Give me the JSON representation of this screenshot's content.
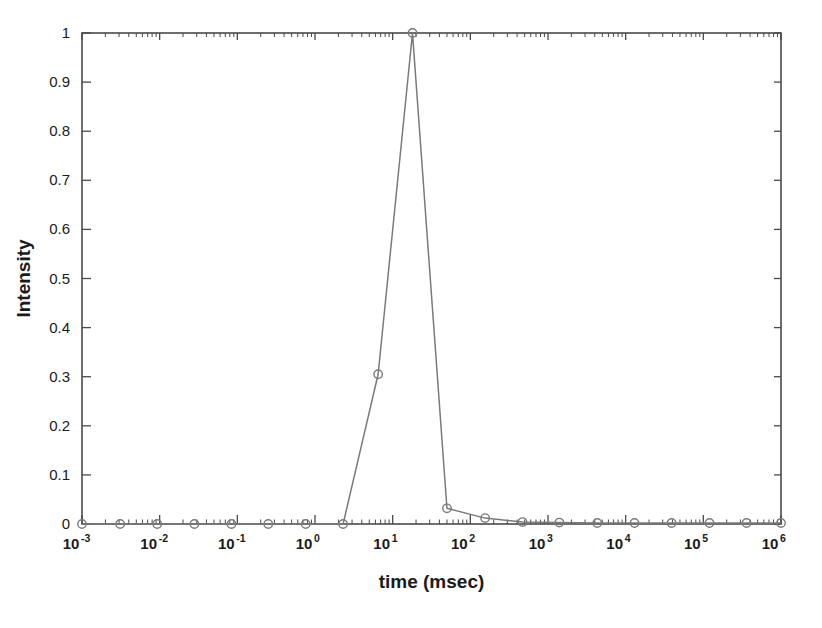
{
  "chart_data": {
    "type": "line",
    "title": "",
    "subtitle": "",
    "xlabel": "time (msec)",
    "ylabel": "Intensity",
    "xscale": "log",
    "yscale": "linear",
    "xlim": [
      0.001,
      1000000
    ],
    "ylim": [
      0,
      1
    ],
    "grid": false,
    "legend": null,
    "marker": "open-circle",
    "line_color": "#7a7a7a",
    "marker_color": "#7a7a7a",
    "x_tick_labels": [
      "10-3",
      "10-2",
      "10-1",
      "100",
      "101",
      "102",
      "103",
      "104",
      "105",
      "106"
    ],
    "x_tick_mantissa": "10",
    "x_tick_exponents": [
      "-3",
      "-2",
      "-1",
      "0",
      "1",
      "2",
      "3",
      "4",
      "5",
      "6"
    ],
    "x_tick_values": [
      0.001,
      0.01,
      0.1,
      1,
      10,
      100,
      1000,
      10000,
      100000,
      1000000
    ],
    "y_tick_labels": [
      "0",
      "0.1",
      "0.2",
      "0.3",
      "0.4",
      "0.5",
      "0.6",
      "0.7",
      "0.8",
      "0.9",
      "1"
    ],
    "y_tick_values": [
      0,
      0.1,
      0.2,
      0.3,
      0.4,
      0.5,
      0.6,
      0.7,
      0.8,
      0.9,
      1
    ],
    "x": [
      0.001,
      0.0031,
      0.0093,
      0.028,
      0.084,
      0.25,
      0.76,
      2.3,
      6.5,
      18,
      50,
      155,
      470,
      1400,
      4300,
      13000,
      39000,
      120000,
      360000,
      1000000
    ],
    "values": [
      0.0,
      0.0,
      0.0,
      0.0,
      0.0,
      0.0,
      0.0,
      0.0,
      0.305,
      1.0,
      0.032,
      0.012,
      0.004,
      0.003,
      0.002,
      0.002,
      0.002,
      0.002,
      0.002,
      0.002
    ],
    "series": [
      {
        "name": "Intensity",
        "x": [
          0.001,
          0.0031,
          0.0093,
          0.028,
          0.084,
          0.25,
          0.76,
          2.3,
          6.5,
          18,
          50,
          155,
          470,
          1400,
          4300,
          13000,
          39000,
          120000,
          360000,
          1000000
        ],
        "values": [
          0.0,
          0.0,
          0.0,
          0.0,
          0.0,
          0.0,
          0.0,
          0.0,
          0.305,
          1.0,
          0.032,
          0.012,
          0.004,
          0.003,
          0.002,
          0.002,
          0.002,
          0.002,
          0.002,
          0.002
        ]
      }
    ],
    "annotations": [],
    "peak": {
      "x": 18,
      "y": 1.0
    }
  }
}
